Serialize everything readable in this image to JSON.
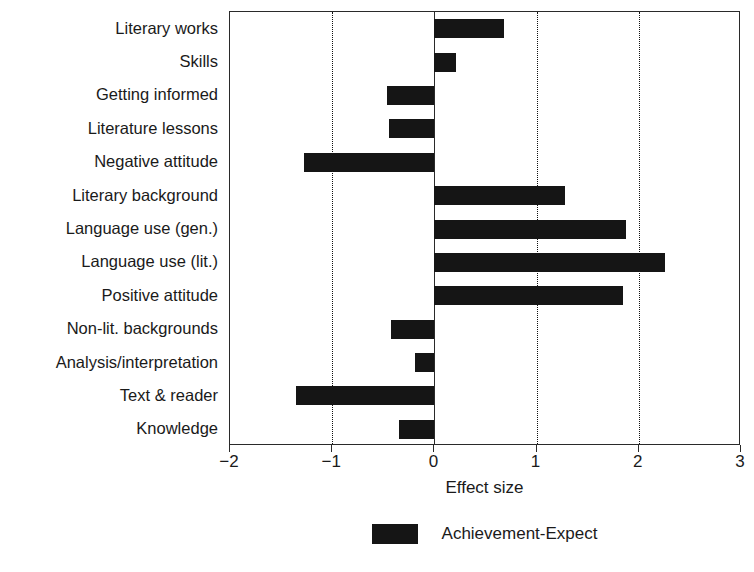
{
  "chart_data": {
    "type": "bar",
    "orientation": "horizontal",
    "title": "",
    "xlabel": "Effect size",
    "ylabel": "",
    "xlim": [
      -2,
      3
    ],
    "xticks": [
      -2,
      -1,
      0,
      1,
      2,
      3
    ],
    "xticklabels": [
      "−2",
      "−1",
      "0",
      "1",
      "2",
      "3"
    ],
    "grid": "vertical dotted gridlines at -1, 1, 2; solid axis line at 0",
    "legend": {
      "position": "below axes, centered",
      "entries": [
        {
          "name": "Achievement-Expect",
          "color": "#151515"
        }
      ]
    },
    "categories": [
      "Literary works",
      "Skills",
      "Getting informed",
      "Literature lessons",
      "Negative attitude",
      "Literary background",
      "Language use (gen.)",
      "Language use (lit.)",
      "Positive attitude",
      "Non-lit. backgrounds",
      "Analysis/interpretation",
      "Text & reader",
      "Knowledge"
    ],
    "series": [
      {
        "name": "Achievement-Expect",
        "color": "#151515",
        "values": [
          0.68,
          0.21,
          -0.46,
          -0.44,
          -1.28,
          1.28,
          1.87,
          2.26,
          1.85,
          -0.42,
          -0.19,
          -1.35,
          -0.35
        ]
      }
    ]
  },
  "axis": {
    "x_title": "Effect size"
  },
  "legend": {
    "label": "Achievement-Expect"
  }
}
